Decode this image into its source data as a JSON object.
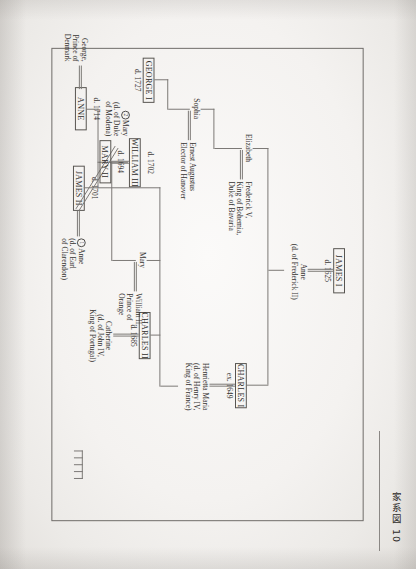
{
  "caption": {
    "text": "家系図 10"
  },
  "figure": {
    "boxes": [
      {
        "id": "james1",
        "name": "JAMES I",
        "date": "d. 1625"
      },
      {
        "id": "charles1",
        "name": "CHARLES I",
        "date": "ex. 1649"
      },
      {
        "id": "charles2",
        "name": "CHARLES II",
        "date": "d. 1685"
      },
      {
        "id": "james2",
        "name": "JAMES II",
        "date": "d. 1701"
      },
      {
        "id": "mary2",
        "name": "MARY II",
        "date": "d. 1694"
      },
      {
        "id": "william3",
        "name": "WILLIAM III",
        "date": "d. 1702"
      },
      {
        "id": "anne",
        "name": "ANNE",
        "date": "d. 1714"
      },
      {
        "id": "george1",
        "name": "GEORGE I",
        "date": "d. 1727"
      }
    ],
    "spouses": [
      {
        "id": "anne_denmark_q",
        "lines": [
          "Anne",
          "(d. of Frederick II)"
        ]
      },
      {
        "id": "henrietta",
        "lines": [
          "Henrietta Maria",
          "(d. of Henry IV,",
          "King of France)"
        ]
      },
      {
        "id": "catherine",
        "lines": [
          "Catherine",
          "(d. of John IV,",
          "King of Portugal)"
        ]
      },
      {
        "id": "anne_clarendon",
        "marker": "1",
        "lines": [
          "Anne",
          "(d. of Earl",
          "of Clarendon)"
        ]
      },
      {
        "id": "mary_modena",
        "marker": "2",
        "lines": [
          "Mary",
          "(d. of Duke",
          "of Modena)"
        ]
      },
      {
        "id": "george_denmark",
        "lines": [
          "George,",
          "Prince of",
          "Denmark"
        ]
      },
      {
        "id": "frederick5",
        "lines": [
          "Frederick V,",
          "King of Bohemia,",
          "Duke of Bavaria"
        ]
      },
      {
        "id": "william2",
        "lines": [
          "William II,",
          "Prince of",
          "Orange"
        ]
      },
      {
        "id": "ernest_augustus",
        "lines": [
          "Ernest Augustus",
          "Elector of Hanover"
        ]
      }
    ],
    "persons": [
      {
        "id": "elizabeth",
        "label": "Elizabeth"
      },
      {
        "id": "sophia",
        "label": "Sophia"
      },
      {
        "id": "mary",
        "label": "Mary"
      }
    ]
  }
}
